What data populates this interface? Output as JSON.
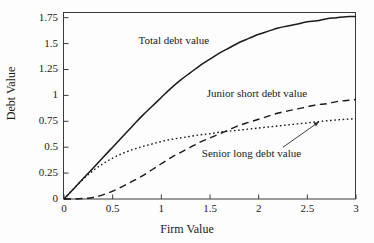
{
  "chart_data": {
    "type": "line",
    "title": "",
    "xlabel": "Firm Value",
    "ylabel": "Debt Value",
    "xlim": [
      0,
      3.0
    ],
    "ylim": [
      0,
      1.8
    ],
    "xticks": [
      "0",
      "0.5",
      "1",
      "1.5",
      "2",
      "2.5",
      "3"
    ],
    "xtick_values": [
      0,
      0.5,
      1,
      1.5,
      2,
      2.5,
      3
    ],
    "yticks": [
      "0",
      "0.25",
      "0.5",
      "0.75",
      "1",
      "1.25",
      "1.5",
      "1.75"
    ],
    "ytick_values": [
      0,
      0.25,
      0.5,
      0.75,
      1,
      1.25,
      1.5,
      1.75
    ],
    "grid": false,
    "legend_position": "inline-annotations",
    "x": [
      0,
      0.1,
      0.2,
      0.3,
      0.4,
      0.5,
      0.6,
      0.7,
      0.8,
      0.9,
      1.0,
      1.1,
      1.2,
      1.3,
      1.4,
      1.5,
      1.6,
      1.7,
      1.8,
      1.9,
      2.0,
      2.1,
      2.2,
      2.3,
      2.4,
      2.5,
      2.6,
      2.7,
      2.8,
      2.9,
      3.0
    ],
    "series": [
      {
        "name": "Total debt value",
        "style": "solid",
        "color": "#1a1a1a",
        "values": [
          0.0,
          0.1,
          0.2,
          0.3,
          0.4,
          0.5,
          0.6,
          0.7,
          0.8,
          0.89,
          0.98,
          1.07,
          1.15,
          1.22,
          1.29,
          1.35,
          1.41,
          1.46,
          1.51,
          1.55,
          1.59,
          1.62,
          1.65,
          1.67,
          1.69,
          1.71,
          1.72,
          1.74,
          1.75,
          1.76,
          1.76
        ]
      },
      {
        "name": "Junior short debt value",
        "style": "dashed",
        "color": "#1a1a1a",
        "values": [
          0.0,
          0.0,
          0.005,
          0.015,
          0.04,
          0.075,
          0.12,
          0.17,
          0.22,
          0.28,
          0.34,
          0.4,
          0.45,
          0.5,
          0.55,
          0.59,
          0.63,
          0.67,
          0.71,
          0.74,
          0.77,
          0.8,
          0.83,
          0.85,
          0.87,
          0.89,
          0.91,
          0.92,
          0.94,
          0.95,
          0.96
        ]
      },
      {
        "name": "Senior long debt value",
        "style": "dotted",
        "color": "#1a1a1a",
        "values": [
          0.0,
          0.1,
          0.195,
          0.275,
          0.34,
          0.395,
          0.44,
          0.475,
          0.505,
          0.53,
          0.555,
          0.575,
          0.59,
          0.605,
          0.62,
          0.63,
          0.645,
          0.655,
          0.665,
          0.675,
          0.685,
          0.695,
          0.705,
          0.715,
          0.725,
          0.735,
          0.745,
          0.755,
          0.763,
          0.77,
          0.775
        ]
      }
    ],
    "annotations": [
      {
        "text": "Total debt value",
        "x": 1.3,
        "y": 1.52
      },
      {
        "text": "Junior short debt value",
        "x": 2.0,
        "y": 1.0
      },
      {
        "text": "Senior long debt value",
        "x": 1.95,
        "y": 0.42
      },
      {
        "text": "leader-arrow",
        "from_x": 2.25,
        "from_y": 0.5,
        "to_x": 2.62,
        "to_y": 0.745
      }
    ]
  }
}
